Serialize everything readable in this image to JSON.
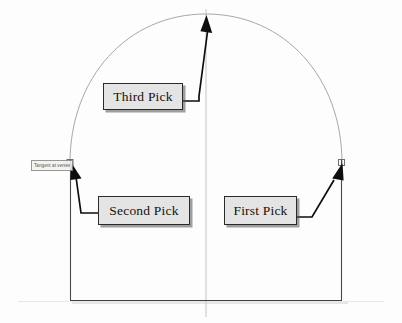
{
  "drawing": {
    "title": "Arch construction pick sequence",
    "background_color": "#fdfdfd",
    "geometry_color": "#9a9a9a",
    "outline_color": "#3c3c3c",
    "leader_color": "#111111",
    "callout_fill": "#e4e4e4",
    "callout_border": "#2a2a2a",
    "apex": {
      "x": 206,
      "y": 14
    },
    "left_spring": {
      "x": 70,
      "y": 163
    },
    "right_spring": {
      "x": 342,
      "y": 163
    },
    "baseline_y": 300,
    "centerline_x": 206
  },
  "osnap": {
    "tooltip_text": "Tangent at vertex",
    "marker_name": "tangent-snap-marker"
  },
  "callouts": [
    {
      "id": "third",
      "label": "Third Pick",
      "target": "apex"
    },
    {
      "id": "second",
      "label": "Second Pick",
      "target": "left-spring-point"
    },
    {
      "id": "first",
      "label": "First Pick",
      "target": "right-spring-point"
    }
  ]
}
